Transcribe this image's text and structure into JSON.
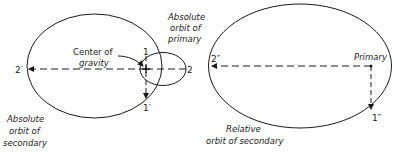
{
  "diagram": {
    "left_figure": {
      "labels": {
        "center_of_gravity_line1": "Center of",
        "center_of_gravity_line2": "gravity",
        "abs_primary_line1": "Absolute",
        "abs_primary_line2": "orbit of",
        "abs_primary_line3": "primary",
        "abs_secondary_line1": "Absolute",
        "abs_secondary_line2": "orbit of",
        "abs_secondary_line3": "secondary"
      },
      "points": {
        "p1": "1",
        "p1_prime": "1′",
        "p2": "2",
        "p2_prime": "2′"
      }
    },
    "right_figure": {
      "labels": {
        "primary": "Primary",
        "relative_line1": "Relative",
        "relative_line2": "orbit of secondary"
      },
      "points": {
        "p1_double_prime": "1″",
        "p2_double_prime": "2″"
      }
    },
    "colors": {
      "stroke": "#1a1a1a",
      "background": "#ffffff"
    }
  }
}
